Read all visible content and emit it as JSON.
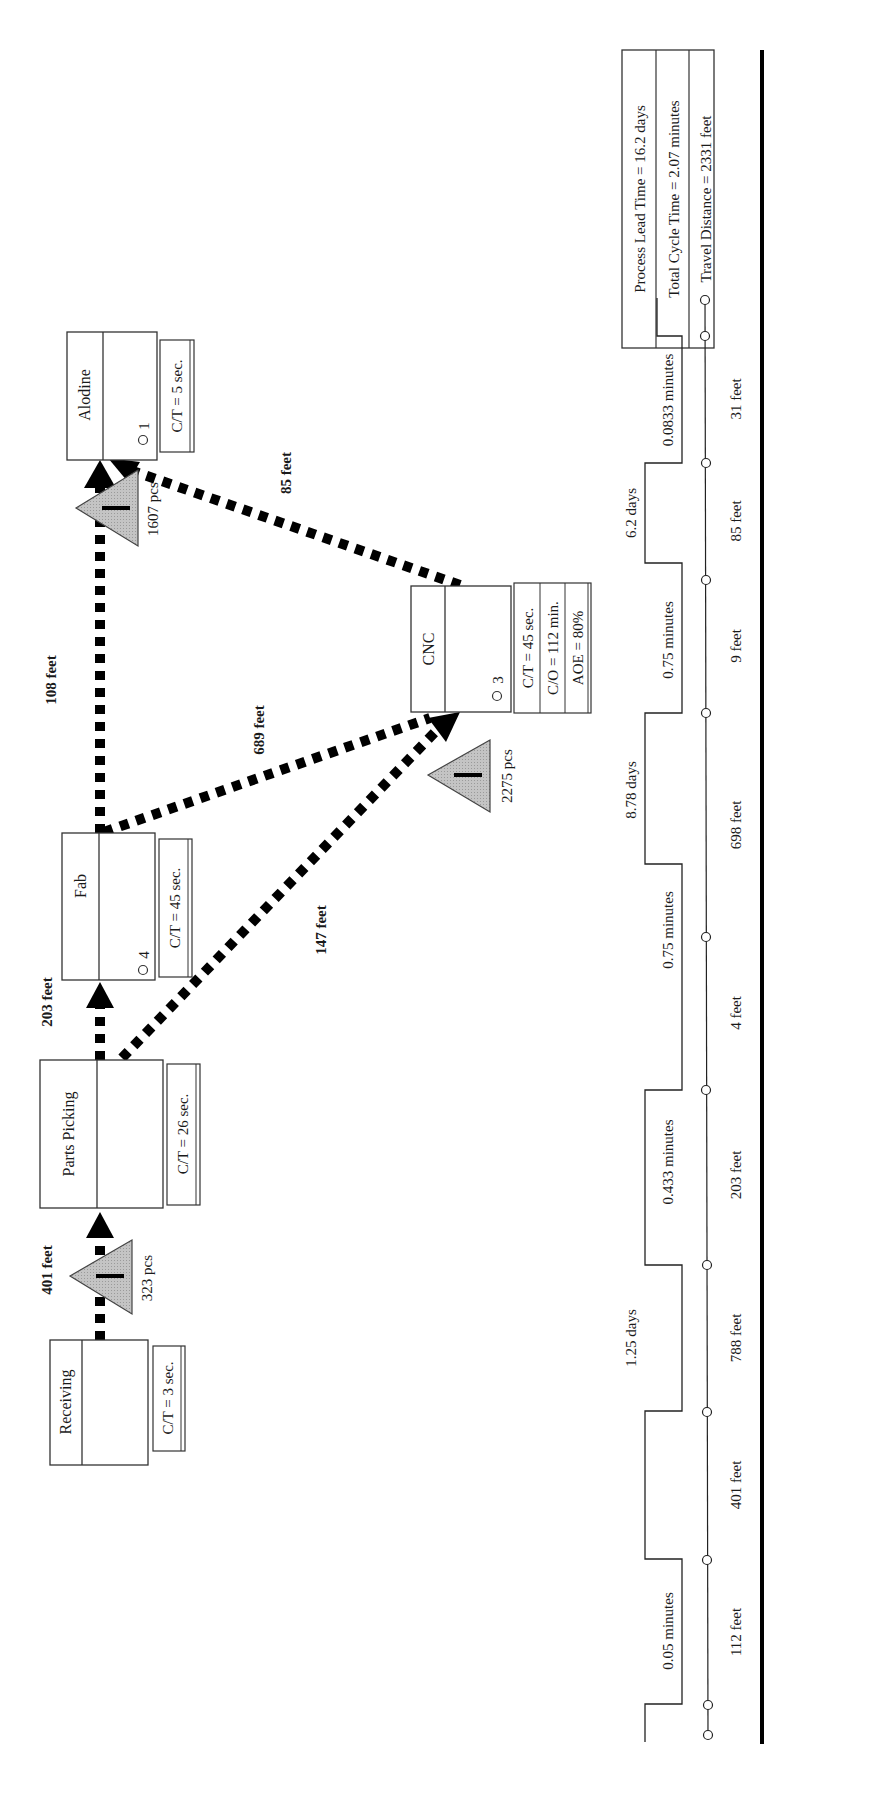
{
  "processes": [
    {
      "name": "Receiving",
      "ct": "C/T = 3 sec.",
      "operators": ""
    },
    {
      "name": "Parts Picking",
      "ct": "C/T = 26 sec.",
      "operators": ""
    },
    {
      "name": "Fab",
      "ct": "C/T = 45 sec.",
      "operators": "4"
    },
    {
      "name": "Alodine",
      "ct": "C/T = 5 sec.",
      "operators": "1"
    },
    {
      "name": "CNC",
      "ct": "C/T = 45 sec.",
      "co": "C/O = 112 min.",
      "aoe": "AOE = 80%",
      "operators": "3"
    }
  ],
  "inventories": [
    {
      "qty": "323 pcs"
    },
    {
      "qty": "1607 pcs"
    },
    {
      "qty": "2275 pcs"
    }
  ],
  "flows": [
    {
      "label": "401 feet"
    },
    {
      "label": "203 feet"
    },
    {
      "label": "147 feet"
    },
    {
      "label": "108 feet"
    },
    {
      "label": "689 feet"
    },
    {
      "label": "85 feet"
    }
  ],
  "timeline": {
    "days": [
      "1.25 days",
      "8.78 days",
      "6.2 days"
    ],
    "minutes": [
      "0.05 minutes",
      "0.433 minutes",
      "0.75 minutes",
      "0.75 minutes",
      "0.0833 minutes"
    ],
    "distances": [
      "112 feet",
      "401 feet",
      "788 feet",
      "203 feet",
      "4 feet",
      "698 feet",
      "9 feet",
      "85 feet",
      "31 feet"
    ]
  },
  "summary": {
    "lead_time": "Process Lead Time = 16.2 days",
    "cycle_time": "Total Cycle Time = 2.07 minutes",
    "travel": "Travel Distance = 2331 feet"
  },
  "colors": {
    "line": "#000000",
    "inventory_fill": "#b8b8b8"
  }
}
